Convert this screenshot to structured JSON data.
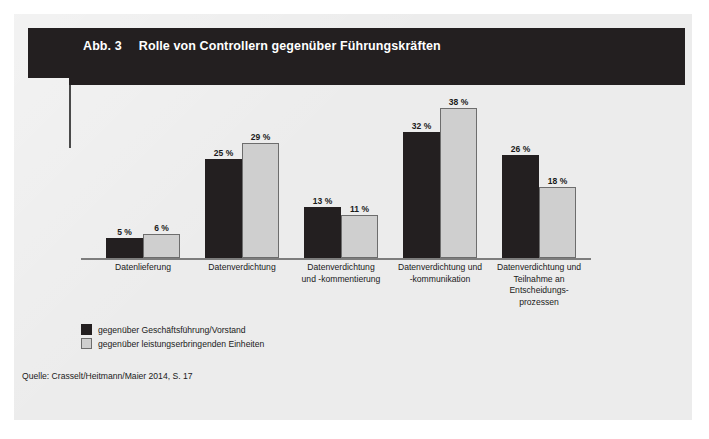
{
  "figure": {
    "number_label": "Abb. 3",
    "title": "Rolle von Controllern gegenüber Führungskräften",
    "source": "Quelle: Crasselt/Heitmann/Maier 2014, S. 17",
    "panel_color": "#ececec",
    "accent_color": "#231f20"
  },
  "chart_data": {
    "type": "bar",
    "title": "Rolle von Controllern gegenüber Führungskräften",
    "xlabel": "",
    "ylabel": "",
    "ylim": [
      0,
      40
    ],
    "grid": false,
    "legend_position": "bottom-left",
    "value_suffix": " %",
    "categories": [
      "Datenlieferung",
      "Datenverdichtung",
      "Datenverdichtung\nund -kommentierung",
      "Datenverdichtung und\n-kommunikation",
      "Datenverdichtung und\nTeilnahme an\nEntscheidungs-\nprozessen"
    ],
    "category_lines": [
      [
        "Datenlieferung"
      ],
      [
        "Datenverdichtung"
      ],
      [
        "Datenverdichtung",
        "und -kommentierung"
      ],
      [
        "Datenverdichtung und",
        "-kommunikation"
      ],
      [
        "Datenverdichtung und",
        "Teilnahme an",
        "Entscheidungs-",
        "prozessen"
      ]
    ],
    "series": [
      {
        "name": "gegenüber Geschäftsführung/Vorstand",
        "color": "#231f20",
        "values": [
          5,
          25,
          13,
          32,
          26
        ],
        "labels": [
          "5 %",
          "25 %",
          "13 %",
          "32 %",
          "26 %"
        ]
      },
      {
        "name": "gegenüber leistungserbringenden Einheiten",
        "color": "#cfcfcf",
        "values": [
          6,
          29,
          11,
          38,
          18
        ],
        "labels": [
          "6 %",
          "29 %",
          "11 %",
          "38 %",
          "18 %"
        ]
      }
    ]
  },
  "legend": [
    {
      "label": "gegenüber Geschäftsführung/Vorstand",
      "swatch": "dark"
    },
    {
      "label": "gegenüber leistungserbringenden Einheiten",
      "swatch": "light"
    }
  ]
}
